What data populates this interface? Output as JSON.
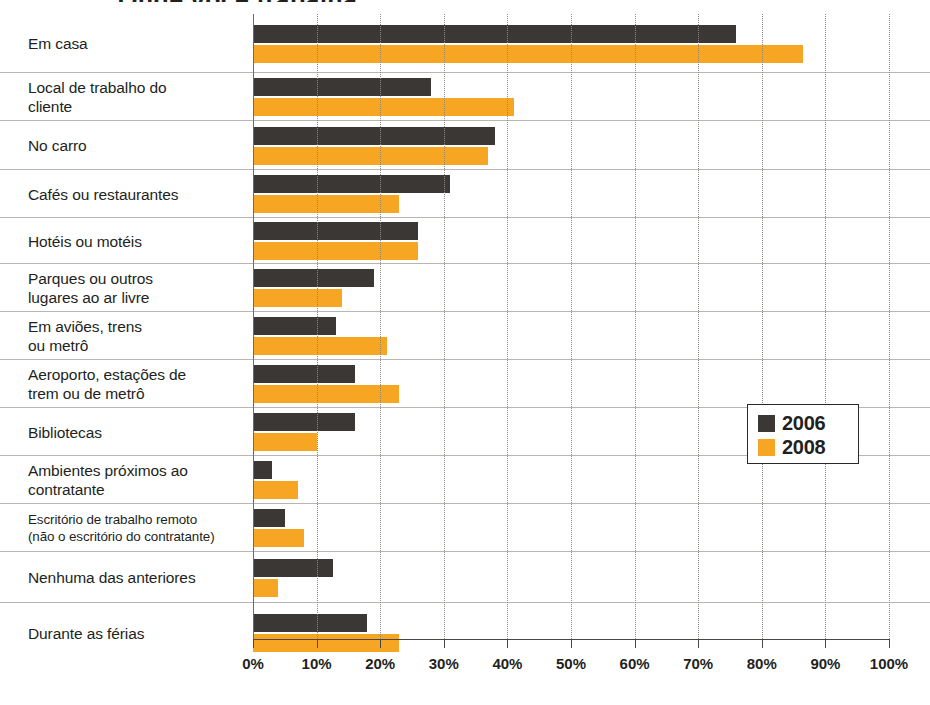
{
  "title_fragment": "Onde você trabalha",
  "legend": {
    "position": "inside-right",
    "items": [
      {
        "label": "2006",
        "color": "#3b3734",
        "icon": "square-swatch"
      },
      {
        "label": "2008",
        "color": "#f6a623",
        "icon": "square-swatch"
      }
    ]
  },
  "colors": {
    "series_2006": "#3b3734",
    "series_2008": "#f6a623",
    "gridline": "#8d8a86",
    "row_separator": "#b9b6b2",
    "axis": "#4a4744",
    "text": "#231f1d",
    "background": "#ffffff"
  },
  "axis": {
    "ticks": [
      "0%",
      "10%",
      "20%",
      "30%",
      "40%",
      "50%",
      "60%",
      "70%",
      "80%",
      "90%",
      "100%"
    ],
    "min": 0,
    "max": 100
  },
  "chart_data": {
    "type": "bar",
    "orientation": "horizontal",
    "title": "Onde você trabalha",
    "xlabel": "",
    "ylabel": "",
    "xlim": [
      0,
      100
    ],
    "xticks": [
      0,
      10,
      20,
      30,
      40,
      50,
      60,
      70,
      80,
      90,
      100
    ],
    "xticklabels": [
      "0%",
      "10%",
      "20%",
      "30%",
      "40%",
      "50%",
      "60%",
      "70%",
      "80%",
      "90%",
      "100%"
    ],
    "grid": true,
    "legend_position": "center-right",
    "categories": [
      "Em casa",
      "Local de trabalho do cliente",
      "No carro",
      "Cafés ou restaurantes",
      "Hotéis ou motéis",
      "Parques ou outros lugares ao ar livre",
      "Em aviões, trens ou metrô",
      "Aeroporto, estações de trem ou de metrô",
      "Bibliotecas",
      "Ambientes próximos ao contratante",
      "Escritório de trabalho remoto (não o escritório do contratante)",
      "Nenhuma das anteriores",
      "Durante as férias"
    ],
    "series": [
      {
        "name": "2006",
        "color": "#3b3734",
        "values": [
          76,
          28,
          38,
          31,
          26,
          19,
          13,
          16,
          16,
          3,
          5,
          12.5,
          18
        ]
      },
      {
        "name": "2008",
        "color": "#f6a623",
        "values": [
          86.5,
          41,
          37,
          23,
          26,
          14,
          21,
          23,
          10,
          7,
          8,
          4,
          23
        ]
      }
    ]
  },
  "rows": [
    {
      "label_lines": [
        "Em casa"
      ],
      "small": false,
      "height": 59
    },
    {
      "label_lines": [
        "Local de trabalho do",
        "cliente"
      ],
      "small": false,
      "height": 48
    },
    {
      "label_lines": [
        "No carro"
      ],
      "small": false,
      "height": 49
    },
    {
      "label_lines": [
        "Cafés ou restaurantes"
      ],
      "small": false,
      "height": 48
    },
    {
      "label_lines": [
        "Hotéis ou motéis"
      ],
      "small": false,
      "height": 46
    },
    {
      "label_lines": [
        "Parques ou outros",
        "lugares ao ar livre"
      ],
      "small": false,
      "height": 48
    },
    {
      "label_lines": [
        "Em aviões, trens",
        "ou metrô"
      ],
      "small": false,
      "height": 48
    },
    {
      "label_lines": [
        "Aeroporto, estações de",
        "trem ou de metrô"
      ],
      "small": false,
      "height": 48
    },
    {
      "label_lines": [
        "Bibliotecas"
      ],
      "small": false,
      "height": 48
    },
    {
      "label_lines": [
        "Ambientes próximos ao",
        "contratante"
      ],
      "small": false,
      "height": 48
    },
    {
      "label_lines": [
        "Escritório de trabalho remoto",
        "(não o escritório do contratante)"
      ],
      "small": true,
      "height": 48
    },
    {
      "label_lines": [
        "Nenhuma das anteriores"
      ],
      "small": false,
      "height": 51
    },
    {
      "label_lines": [
        "Durante as férias"
      ],
      "small": false,
      "height": 60
    }
  ]
}
